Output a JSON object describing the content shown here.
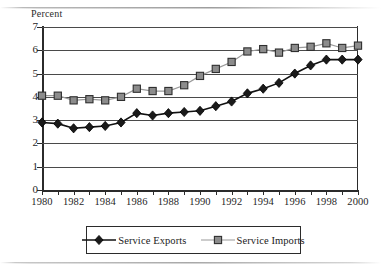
{
  "axis_title": "Percent",
  "legend": {
    "items": [
      {
        "label": "Service Exports",
        "marker": "diamond-marker-icon",
        "color": "#1a1a1a"
      },
      {
        "label": "Service Imports",
        "marker": "square-marker-icon",
        "color": "#8c8c8c"
      }
    ]
  },
  "chart_data": {
    "type": "line",
    "title": "",
    "subtitle": "",
    "xlabel": "",
    "ylabel": "Percent",
    "xlim": [
      1980,
      2000
    ],
    "ylim": [
      0,
      7
    ],
    "grid": true,
    "legend_position": "bottom",
    "x": [
      1980,
      1981,
      1982,
      1983,
      1984,
      1985,
      1986,
      1987,
      1988,
      1989,
      1990,
      1991,
      1992,
      1993,
      1994,
      1995,
      1996,
      1997,
      1998,
      1999,
      2000
    ],
    "y_ticks": [
      0,
      1,
      2,
      3,
      4,
      5,
      6,
      7
    ],
    "x_tick_labels": [
      "1980",
      "1982",
      "1984",
      "1986",
      "1988",
      "1990",
      "1992",
      "1994",
      "1996",
      "1998",
      "2000"
    ],
    "series": [
      {
        "name": "Service Exports",
        "marker": "diamond",
        "color": "#1a1a1a",
        "values": [
          2.9,
          2.85,
          2.65,
          2.7,
          2.75,
          2.9,
          3.3,
          3.2,
          3.3,
          3.35,
          3.4,
          3.6,
          3.8,
          4.15,
          4.35,
          4.6,
          5.0,
          5.35,
          5.6,
          5.6,
          5.6
        ]
      },
      {
        "name": "Service Imports",
        "marker": "square",
        "color": "#8c8c8c",
        "values": [
          4.05,
          4.05,
          3.85,
          3.9,
          3.85,
          4.0,
          4.35,
          4.25,
          4.25,
          4.5,
          4.9,
          5.2,
          5.5,
          5.95,
          6.05,
          5.9,
          6.1,
          6.15,
          6.3,
          6.1,
          6.2
        ]
      }
    ]
  }
}
